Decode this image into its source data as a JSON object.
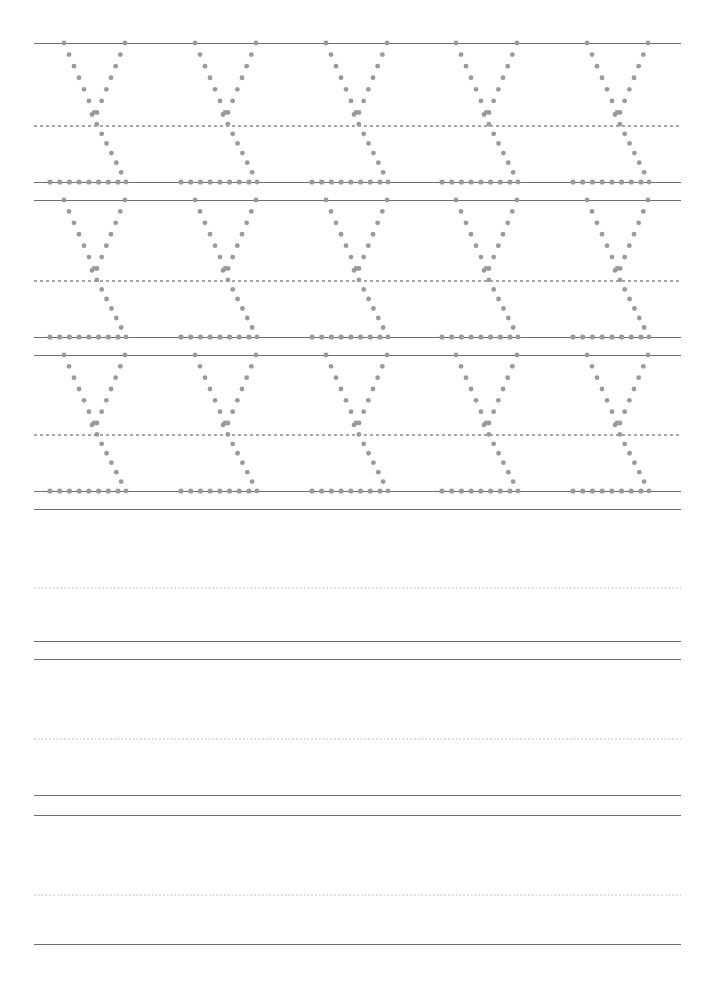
{
  "document": {
    "kind": "handwriting-tracing-worksheet",
    "title": "Letter Y Tracing Practice",
    "page_width": 713,
    "page_height": 989,
    "background_color": "#ffffff",
    "traced_letter": "y",
    "letters_per_row": 5,
    "traced_rows": 3,
    "blank_rows": 3
  },
  "style": {
    "solid_line_color": "#7a7a7a",
    "solid_line_color_dark": "#5c5c5c",
    "dashed_mid_color": "#555555",
    "dashed_faint_color": "#b5b5b5",
    "dot_color": "#9a9a9a",
    "line_left": 34,
    "line_right": 681,
    "line_width": 647,
    "solid_thickness": 1.2,
    "dashed_thickness": 1
  },
  "rules": [
    {
      "id": "r1",
      "type": "solid",
      "y": 43,
      "weight": 1.2,
      "color": "#6e6e6e",
      "label": "row-1-top-line"
    },
    {
      "id": "r2",
      "type": "dashed",
      "y": 113,
      "weight": 1.1,
      "color": "#4f4f4f",
      "label": "row-1-midline",
      "dash": "3 3"
    },
    {
      "id": "r3",
      "type": "solid",
      "y": 182,
      "weight": 1.2,
      "color": "#6e6e6e",
      "label": "row-1-baseline"
    },
    {
      "id": "r4",
      "type": "solid",
      "y": 200,
      "weight": 1.2,
      "color": "#6e6e6e",
      "label": "row-2-top-line"
    },
    {
      "id": "r5",
      "type": "dashed",
      "y": 268,
      "weight": 1.1,
      "color": "#4f4f4f",
      "label": "row-2-midline",
      "dash": "3 3"
    },
    {
      "id": "r6",
      "type": "solid",
      "y": 337,
      "weight": 1.2,
      "color": "#6e6e6e",
      "label": "row-2-baseline"
    },
    {
      "id": "r7",
      "type": "solid",
      "y": 355,
      "weight": 1.2,
      "color": "#6e6e6e",
      "label": "row-3-top-line"
    },
    {
      "id": "r8",
      "type": "dashed",
      "y": 422,
      "weight": 1.1,
      "color": "#4f4f4f",
      "label": "row-3-midline",
      "dash": "3 3"
    },
    {
      "id": "r9",
      "type": "solid",
      "y": 491,
      "weight": 1.2,
      "color": "#6e6e6e",
      "label": "row-3-baseline"
    },
    {
      "id": "r10",
      "type": "solid",
      "y": 509,
      "weight": 1.2,
      "color": "#6e6e6e",
      "label": "row-4-top-line"
    },
    {
      "id": "r11",
      "type": "dashed",
      "y": 575,
      "weight": 1,
      "color": "#b5b5b5",
      "label": "row-4-midline",
      "dash": "1.6 2.2"
    },
    {
      "id": "r12",
      "type": "solid",
      "y": 641,
      "weight": 1.2,
      "color": "#6e6e6e",
      "label": "row-4-baseline"
    },
    {
      "id": "r13",
      "type": "solid",
      "y": 659,
      "weight": 1.2,
      "color": "#6e6e6e",
      "label": "row-5-top-line"
    },
    {
      "id": "r14",
      "type": "dashed",
      "y": 726,
      "weight": 1,
      "color": "#b5b5b5",
      "label": "row-5-midline",
      "dash": "1.6 2.2"
    },
    {
      "id": "r15",
      "type": "solid",
      "y": 795,
      "weight": 1.2,
      "color": "#6e6e6e",
      "label": "row-5-baseline"
    },
    {
      "id": "r16",
      "type": "solid",
      "y": 815,
      "weight": 1.2,
      "color": "#6e6e6e",
      "label": "row-6-top-line"
    },
    {
      "id": "r17",
      "type": "dashed",
      "y": 882,
      "weight": 1,
      "color": "#b5b5b5",
      "label": "row-6-midline",
      "dash": "1.6 2.2"
    },
    {
      "id": "r18",
      "type": "solid",
      "y": 944,
      "weight": 1.2,
      "color": "#6e6e6e",
      "label": "row-6-baseline"
    }
  ],
  "letter_rows": [
    {
      "id": "traced-row-1",
      "top_y": 43,
      "mid_y": 113,
      "base_y": 182,
      "glyph_x": [
        48,
        179,
        310,
        440,
        571
      ],
      "letter": "y"
    },
    {
      "id": "traced-row-2",
      "top_y": 200,
      "mid_y": 268,
      "base_y": 337,
      "glyph_x": [
        48,
        179,
        310,
        440,
        571
      ],
      "letter": "y"
    },
    {
      "id": "traced-row-3",
      "top_y": 355,
      "mid_y": 422,
      "base_y": 491,
      "glyph_x": [
        48,
        179,
        310,
        440,
        571
      ],
      "letter": "y"
    }
  ],
  "glyph_template": {
    "name": "lowercase-y-dotted",
    "description": "Dotted guide letter: left diagonal descends from x-height to the midline, right diagonal descends from x-height through the midline down to the baseline, plus a baseline lead-in row of dots.",
    "width": 96,
    "dot_radius_top": 2.4,
    "dot_radius_base": 2.6,
    "strokes": [
      {
        "name": "left-diagonal-upper",
        "from": [
          16,
          0
        ],
        "to": [
          46,
          70
        ],
        "dots": 7
      },
      {
        "name": "right-diagonal-upper",
        "from": [
          77,
          0
        ],
        "to": [
          49,
          70
        ],
        "dots": 7
      },
      {
        "name": "descender-diagonal",
        "from": [
          44,
          72
        ],
        "to": [
          78,
          140
        ],
        "dots": 8
      },
      {
        "name": "lead-in-baseline",
        "from": [
          2,
          140
        ],
        "to": [
          70,
          140
        ],
        "dots": 8
      }
    ]
  }
}
